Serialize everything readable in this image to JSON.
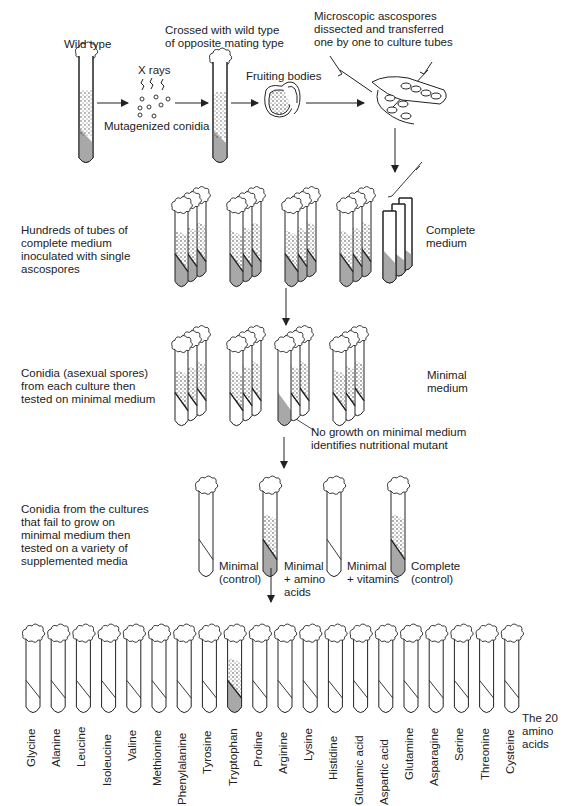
{
  "figure": {
    "topic": "Isolation of nutritional (auxotrophic) mutants of Neurospora",
    "colors": {
      "ink": "#222222",
      "medium_fill": "#a8a8a8",
      "background": "#ffffff"
    }
  },
  "step1": {
    "wild_type_label": "Wild  type",
    "xrays_label": "X rays",
    "mutagenized_label": "Mutagenized conidia",
    "crossed_label": [
      "Crossed with wild type",
      "of opposite mating type"
    ],
    "fruiting_label": "Fruiting bodies",
    "dissection_label": [
      "Microscopic ascospores",
      "dissected and transferred",
      "one by one to culture tubes"
    ]
  },
  "step2": {
    "description": [
      "Hundreds of tubes of",
      "complete medium",
      "inoculated with single",
      "ascospores"
    ],
    "medium_label": [
      "Complete",
      "medium"
    ]
  },
  "step3": {
    "description": [
      "Conidia (asexual spores)",
      "from each culture then",
      "tested on minimal medium"
    ],
    "medium_label": [
      "Minimal",
      "medium"
    ],
    "callout": [
      "No growth on minimal medium",
      "identifies nutritional mutant"
    ]
  },
  "step4": {
    "description": [
      "Conidia from the cultures",
      "that fail to grow on",
      "minimal medium then",
      "tested on a variety of",
      "supplemented media"
    ],
    "tubes": [
      {
        "label": [
          "Minimal",
          "(control)"
        ],
        "growth": false
      },
      {
        "label": [
          "Minimal",
          "+ amino",
          "acids"
        ],
        "growth": true
      },
      {
        "label": [
          "Minimal",
          "+ vitamins"
        ],
        "growth": false
      },
      {
        "label": [
          "Complete",
          "(control)"
        ],
        "growth": true
      }
    ]
  },
  "step5": {
    "group_label": [
      "The 20",
      "amino",
      "acids"
    ],
    "amino_acids": [
      {
        "name": "Glycine",
        "growth": false
      },
      {
        "name": "Alanine",
        "growth": false
      },
      {
        "name": "Leucine",
        "growth": false
      },
      {
        "name": "Isoleucine",
        "growth": false
      },
      {
        "name": "Valine",
        "growth": false
      },
      {
        "name": "Methionine",
        "growth": false
      },
      {
        "name": "Phenylalanine",
        "growth": false
      },
      {
        "name": "Tyrosine",
        "growth": false
      },
      {
        "name": "Tryptophan",
        "growth": true
      },
      {
        "name": "Proline",
        "growth": false
      },
      {
        "name": "Arginine",
        "growth": false
      },
      {
        "name": "Lysine",
        "growth": false
      },
      {
        "name": "Histidine",
        "growth": false
      },
      {
        "name": "Glutamic acid",
        "growth": false
      },
      {
        "name": "Aspartic acid",
        "growth": false
      },
      {
        "name": "Glutamine",
        "growth": false
      },
      {
        "name": "Asparagine",
        "growth": false
      },
      {
        "name": "Serine",
        "growth": false
      },
      {
        "name": "Threonine",
        "growth": false
      },
      {
        "name": "Cysteine",
        "growth": false
      }
    ]
  }
}
